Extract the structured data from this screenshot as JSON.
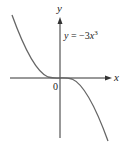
{
  "figure": {
    "equation_label": "y = −3x³",
    "equation_parts": {
      "lhs": "y",
      "eq": " = −3",
      "var": "x",
      "exp": "3"
    },
    "x_axis_label": "x",
    "y_axis_label": "y",
    "origin_label": "0",
    "function": "y = -3x^3",
    "colors": {
      "axis": "#333333",
      "curve": "#666666",
      "background": "#ffffff"
    }
  }
}
